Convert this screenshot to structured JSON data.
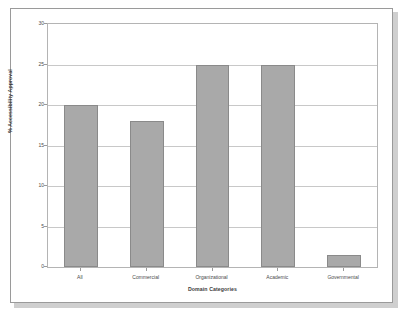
{
  "chart_data": {
    "type": "bar",
    "title": "",
    "xlabel": "Domain Categories",
    "ylabel": "% Accessibility Approval",
    "categories": [
      "All",
      "Commercial",
      "Organizational",
      "Academic",
      "Governmental"
    ],
    "values": [
      20,
      18,
      25,
      25,
      1.5
    ],
    "series": [
      {
        "name": "% Accessibility Approval",
        "values": [
          20,
          18,
          25,
          25,
          1.5
        ]
      }
    ],
    "ylim": [
      0,
      30
    ],
    "yticks": [
      0,
      5,
      10,
      15,
      20,
      25,
      30
    ],
    "ytick_labels": [
      "0",
      "5",
      "10",
      "15",
      "20",
      "25",
      "30"
    ],
    "grid": true,
    "grid_axis": "y",
    "legend": false,
    "legend_position": "none",
    "bar_color": "#a9a9a9",
    "bar_edge_color": "#8a8a8a",
    "gridline_color": "#c8c8c8",
    "plot_border_color": "#b4b4b4",
    "frame_border_color": "#9a9a9a",
    "background_color": "#ffffff",
    "annotations": []
  }
}
